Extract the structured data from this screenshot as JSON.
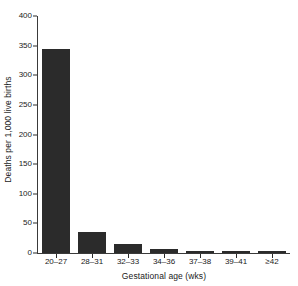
{
  "chart_data": {
    "type": "bar",
    "title": "",
    "subtitle": "",
    "xlabel": "Gestational age (wks)",
    "ylabel": "Deaths per 1,000 live births",
    "categories": [
      "20–27",
      "28–31",
      "32–33",
      "34–36",
      "37–38",
      "39–41",
      "≥42"
    ],
    "values": [
      345,
      35,
      15,
      6,
      2,
      1.5,
      1.5
    ],
    "series": [
      {
        "name": "Deaths per 1,000 live births",
        "values": [
          345,
          35,
          15,
          6,
          2,
          1.5,
          1.5
        ]
      }
    ],
    "ylim": [
      0,
      400
    ],
    "ytick_values": [
      0,
      50,
      100,
      150,
      200,
      250,
      300,
      350,
      400
    ],
    "ytick_labels": [
      "0",
      "50",
      "100",
      "150",
      "200",
      "250",
      "300",
      "350",
      "400"
    ],
    "grid": false,
    "legend": false,
    "legend_position": "none",
    "bar_color": "#2b2b2b",
    "axis_color": "#3a3a3a",
    "background_color": "#ffffff"
  }
}
